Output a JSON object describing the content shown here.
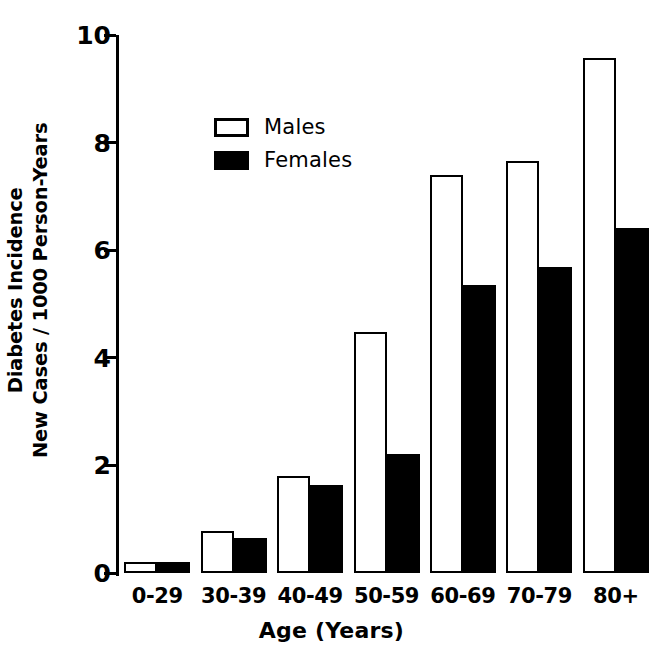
{
  "chart_data": {
    "type": "bar",
    "title": "",
    "xlabel": "Age (Years)",
    "ylabel_line1": "Diabetes Incidence",
    "ylabel_line2": "New Cases / 1000 Person-Years",
    "categories": [
      "0-29",
      "30-39",
      "40-49",
      "50-59",
      "60-69",
      "70-79",
      "80+"
    ],
    "series": [
      {
        "name": "Males",
        "color": "#ffffff",
        "values": [
          0.2,
          0.78,
          1.8,
          4.48,
          7.4,
          7.65,
          9.58
        ]
      },
      {
        "name": "Females",
        "color": "#000000",
        "values": [
          0.2,
          0.65,
          1.63,
          2.22,
          5.35,
          5.68,
          6.42
        ]
      }
    ],
    "ylim": [
      0,
      10
    ],
    "yticks": [
      0,
      2,
      4,
      6,
      8,
      10
    ],
    "yticklabels": [
      "0",
      "2",
      "4",
      "6",
      "8",
      "10"
    ],
    "grid": false,
    "legend_position": "upper-left-inside"
  },
  "legend": {
    "entries": [
      {
        "label": "Males",
        "swatch": "open-rect-icon"
      },
      {
        "label": "Females",
        "swatch": "filled-rect-icon"
      }
    ]
  }
}
